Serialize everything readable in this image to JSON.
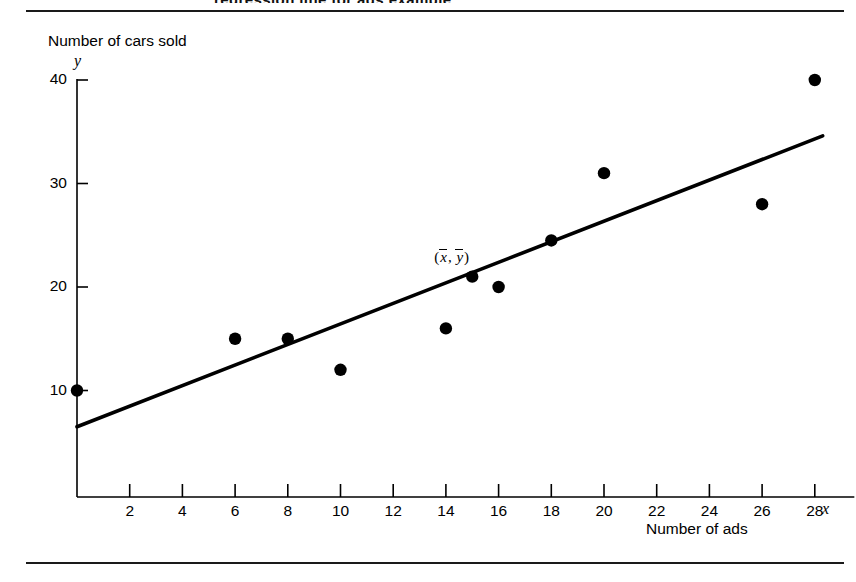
{
  "page": {
    "clipped_title_fragment": "regression line for ads example",
    "background_color": "#ffffff",
    "ink_color": "#000000"
  },
  "chart_data": {
    "type": "scatter",
    "title": "",
    "subtitle": "",
    "xlabel": "Number of ads",
    "ylabel": "Number of cars sold",
    "x_axis_variable": "x",
    "y_axis_variable": "y",
    "xlim": [
      0,
      29.5
    ],
    "ylim": [
      0,
      42
    ],
    "grid": false,
    "legend": "none",
    "xticks": [
      2,
      4,
      6,
      8,
      10,
      12,
      14,
      16,
      18,
      20,
      22,
      24,
      26,
      28
    ],
    "xtick_labels": [
      "2",
      "4",
      "6",
      "8",
      "10",
      "12",
      "14",
      "16",
      "18",
      "20",
      "22",
      "24",
      "26",
      "28"
    ],
    "yticks": [
      10,
      20,
      30,
      40
    ],
    "ytick_labels": [
      "10",
      "20",
      "30",
      "40"
    ],
    "series": [
      {
        "name": "Observations",
        "marker": "filled-circle",
        "marker_color": "#000000",
        "x": [
          0,
          6,
          8,
          10,
          14,
          15,
          16,
          18,
          20,
          26,
          28
        ],
        "y": [
          10,
          15,
          15,
          12,
          16,
          21,
          20,
          24.5,
          31,
          28,
          40
        ],
        "points": [
          {
            "x": 0,
            "y": 10
          },
          {
            "x": 6,
            "y": 15
          },
          {
            "x": 8,
            "y": 15
          },
          {
            "x": 10,
            "y": 12
          },
          {
            "x": 14,
            "y": 16
          },
          {
            "x": 15,
            "y": 21
          },
          {
            "x": 16,
            "y": 20
          },
          {
            "x": 18,
            "y": 24.5
          },
          {
            "x": 20,
            "y": 31
          },
          {
            "x": 26,
            "y": 28
          },
          {
            "x": 28,
            "y": 40
          }
        ]
      }
    ],
    "trend_line": {
      "name": "Least-squares regression line",
      "color": "#000000",
      "x_start": 0,
      "y_start": 6.5,
      "x_end": 28.3,
      "y_end": 34.6
    },
    "annotations": [
      {
        "name": "centroid-label",
        "text_parts": [
          "(",
          "x",
          ", ",
          "y",
          ")"
        ],
        "meaning": "(x-bar, y-bar)",
        "x": 15,
        "y": 21,
        "label_offset_x": -38,
        "label_offset_y": -28
      }
    ]
  }
}
